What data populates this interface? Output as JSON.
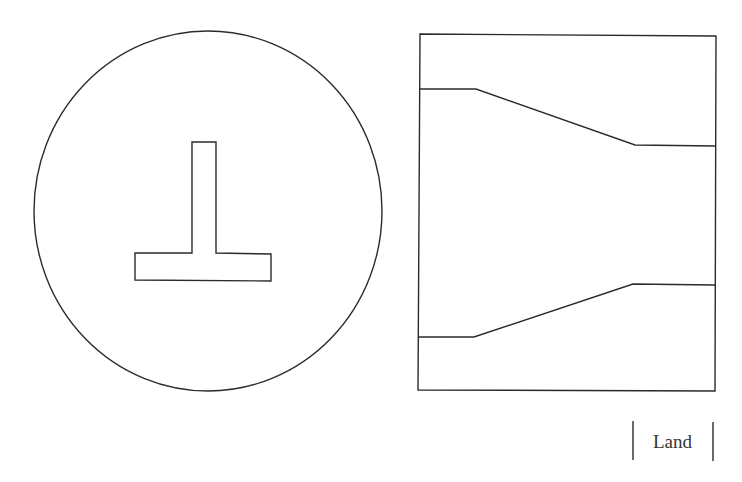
{
  "figure": {
    "left_panel": {
      "name": "cross-section view",
      "outline_shape": "circle",
      "inner_shape": "inverted-T"
    },
    "right_panel": {
      "name": "longitudinal view",
      "outline_shape": "rectangle",
      "profile": "tapered channel narrowing from left to right"
    },
    "label": {
      "text": "Land"
    },
    "colors": {
      "stroke": "#2b2b2b",
      "background": "#ffffff",
      "text": "#333333"
    }
  }
}
